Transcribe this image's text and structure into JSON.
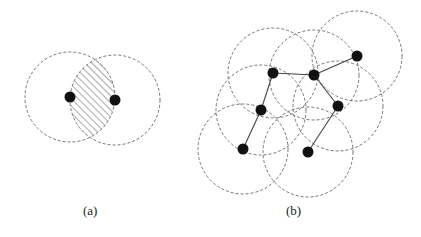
{
  "figure": {
    "panels": [
      {
        "id": "a",
        "caption": "(a)",
        "description": "Two overlapping sensing disks; hatched lens-shaped intersection region",
        "nodes": [
          {
            "id": "A1",
            "x": 70,
            "y": 97
          },
          {
            "id": "A2",
            "x": 115,
            "y": 100
          }
        ],
        "range_radius": 45,
        "hatched_region": "intersection of the two disks"
      },
      {
        "id": "b",
        "caption": "(b)",
        "description": "Seven nodes with dashed sensing-range circles, connected in a tree",
        "nodes": [
          {
            "id": "N1",
            "x": 273,
            "y": 73
          },
          {
            "id": "N2",
            "x": 314,
            "y": 75
          },
          {
            "id": "N3",
            "x": 357,
            "y": 56
          },
          {
            "id": "N4",
            "x": 261,
            "y": 110
          },
          {
            "id": "N5",
            "x": 338,
            "y": 106
          },
          {
            "id": "N6",
            "x": 243,
            "y": 149
          },
          {
            "id": "N7",
            "x": 308,
            "y": 152
          }
        ],
        "edges": [
          [
            "N1",
            "N2"
          ],
          [
            "N2",
            "N3"
          ],
          [
            "N1",
            "N4"
          ],
          [
            "N4",
            "N6"
          ],
          [
            "N2",
            "N5"
          ],
          [
            "N5",
            "N7"
          ]
        ],
        "range_radius": 45
      }
    ],
    "colors": {
      "node": "#111111",
      "circle_stroke": "#666666",
      "edge": "#444444",
      "hatch": "#555555"
    }
  }
}
